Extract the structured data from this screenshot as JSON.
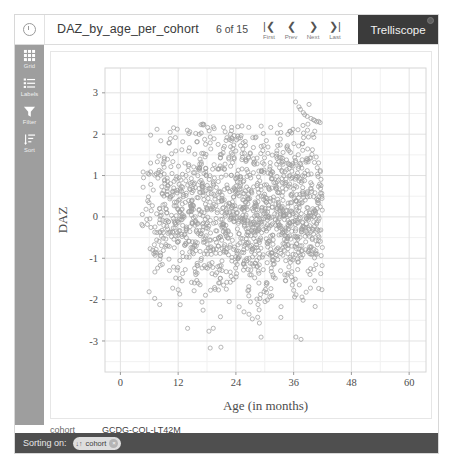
{
  "header": {
    "info_icon": "info-icon",
    "display_title": "DAZ_by_age_per_cohort",
    "page_count": "6 of 15",
    "nav": [
      {
        "name": "first",
        "glyph": "|❮",
        "label": "First"
      },
      {
        "name": "prev",
        "glyph": "❮",
        "label": "Prev"
      },
      {
        "name": "next",
        "glyph": "❯",
        "label": "Next"
      },
      {
        "name": "last",
        "glyph": "❯|",
        "label": "Last"
      }
    ],
    "brand": "Trelliscope"
  },
  "sidebar": {
    "items": [
      {
        "icon": "grid-icon",
        "label": "Grid"
      },
      {
        "icon": "labels-icon",
        "label": "Labels"
      },
      {
        "icon": "filter-icon",
        "label": "Filter"
      },
      {
        "icon": "sort-icon",
        "label": "Sort"
      }
    ]
  },
  "meta": {
    "key": "cohort",
    "value": "GCDG-COL-LT42M"
  },
  "footer": {
    "label": "Sorting on:",
    "chip": {
      "icon": "↓↑",
      "text": "cohort",
      "close": "×"
    }
  },
  "colors": {
    "brand_bg": "#3b3b3b",
    "sidebar_bg": "#9e9e9e",
    "footer_bg": "#4f4f4f",
    "point": "#7a7a7a",
    "grid_major": "#e2e2e2",
    "grid_minor": "#f1f1f1",
    "panel_border": "#d6d6d6"
  },
  "chart_data": {
    "type": "scatter",
    "title": "",
    "xlabel": "Age (in months)",
    "ylabel": "DAZ",
    "xlim": [
      -3.2,
      63.5
    ],
    "ylim": [
      -3.75,
      3.6
    ],
    "xticks": [
      0,
      12,
      24,
      36,
      48,
      60
    ],
    "yticks": [
      -3,
      -2,
      -1,
      0,
      1,
      2,
      3
    ],
    "xticks_minor": [
      6,
      18,
      30,
      42,
      54
    ],
    "yticks_minor": [
      -3.5,
      -2.5,
      -1.5,
      -0.5,
      0.5,
      1.5,
      2.5
    ],
    "grid": true,
    "legend": false,
    "marker": {
      "shape": "open-circle",
      "size": 3.0,
      "color": "#808080",
      "opacity": 0.75
    },
    "point_count": 1500,
    "distribution_note": "dense cloud spanning x 4 to 42 months, DAZ centered near 0.1 with sd about 1.05; density peaks between 12 and 36 months; a separate diagonal streak of ~12 points sits near x 37-42, DAZ 2.35-2.85",
    "cluster": {
      "x": [
        36.4,
        37.1,
        37.4,
        38.0,
        38.3,
        38.8,
        39.2,
        39.6,
        40.1,
        40.4,
        40.8,
        41.2,
        41.5
      ],
      "y": [
        2.78,
        2.66,
        2.6,
        2.52,
        2.47,
        2.43,
        2.72,
        2.38,
        2.35,
        2.33,
        2.3,
        2.31,
        2.28
      ]
    },
    "seed": 20240611
  }
}
